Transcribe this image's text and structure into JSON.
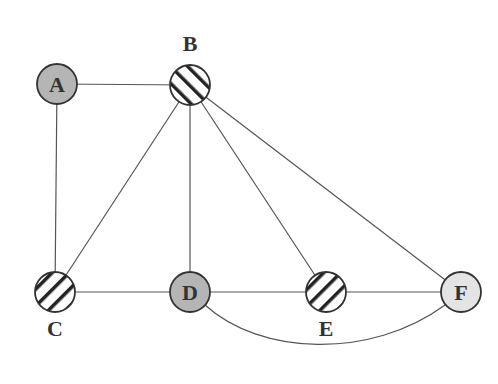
{
  "diagram": {
    "type": "graph",
    "nodes": [
      {
        "id": "A",
        "label": "A",
        "x": 57,
        "y": 84,
        "fill": "gray",
        "label_position": "inside"
      },
      {
        "id": "B",
        "label": "B",
        "x": 190,
        "y": 85,
        "fill": "hatched",
        "label_position": "above"
      },
      {
        "id": "C",
        "label": "C",
        "x": 55,
        "y": 292,
        "fill": "hatched",
        "label_position": "below"
      },
      {
        "id": "D",
        "label": "D",
        "x": 190,
        "y": 292,
        "fill": "gray",
        "label_position": "inside"
      },
      {
        "id": "E",
        "label": "E",
        "x": 326,
        "y": 292,
        "fill": "hatched",
        "label_position": "below"
      },
      {
        "id": "F",
        "label": "F",
        "x": 461,
        "y": 292,
        "fill": "light-gray",
        "label_position": "inside"
      }
    ],
    "edges": [
      [
        "A",
        "B"
      ],
      [
        "A",
        "C"
      ],
      [
        "B",
        "C"
      ],
      [
        "B",
        "D"
      ],
      [
        "B",
        "E"
      ],
      [
        "B",
        "F"
      ],
      [
        "C",
        "D"
      ],
      [
        "D",
        "E"
      ],
      [
        "E",
        "F"
      ],
      [
        "D",
        "F",
        "curved"
      ]
    ],
    "colors": {
      "gray": "#b5b5b5",
      "light-gray": "#e4e4e4",
      "hatched": "#ffffff",
      "stroke": "#333333"
    }
  }
}
